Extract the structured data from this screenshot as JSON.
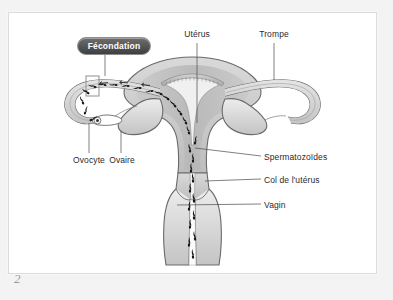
{
  "page": {
    "number": "2",
    "background_color": "#f3f3f3",
    "panel_color": "#ffffff",
    "panel_border_color": "#dcdcdc"
  },
  "badge": {
    "label": "Fécondation",
    "text_color": "#ffffff",
    "fill_top": "#6e6e6e",
    "fill_bottom": "#3f3f3f"
  },
  "labels": {
    "uterus": "Utérus",
    "trompe": "Trompe",
    "ovocyte": "Ovocyte",
    "ovaire": "Ovaire",
    "spermatozoides": "Spermatozoïdes",
    "col_uterus": "Col de l'utérus",
    "vagin": "Vagin"
  },
  "diagram": {
    "line_color": "#555555",
    "organ_outline": "#6a6a6a",
    "organ_fill_light": "#e8e8e8",
    "organ_fill_mid": "#cfcfcf",
    "organ_fill_dark": "#b4b4b4",
    "sperm_color": "#1a1a1a"
  }
}
